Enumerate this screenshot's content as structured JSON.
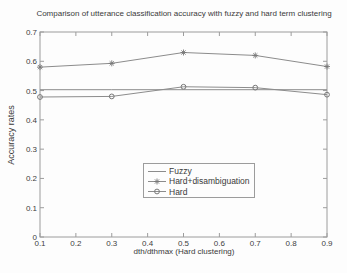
{
  "chart_data": {
    "type": "line",
    "title": "Comparison of utterance classification accuracy with fuzzy and hard term clustering",
    "xlabel": "dth/dthmax (Hard clustering)",
    "ylabel": "Accuracy rates",
    "xlim": [
      0.1,
      0.9
    ],
    "ylim": [
      0,
      0.7
    ],
    "xticks": [
      0.1,
      0.2,
      0.3,
      0.4,
      0.5,
      0.6,
      0.7,
      0.8,
      0.9
    ],
    "yticks": [
      0,
      0.1,
      0.2,
      0.3,
      0.4,
      0.5,
      0.6,
      0.7
    ],
    "x": [
      0.1,
      0.3,
      0.5,
      0.7,
      0.9
    ],
    "series": [
      {
        "name": "Fuzzy",
        "marker": "none",
        "values": [
          0.503,
          0.503,
          0.503,
          0.503,
          0.503
        ]
      },
      {
        "name": "Hard+disambiguation",
        "marker": "asterisk",
        "values": [
          0.58,
          0.593,
          0.63,
          0.62,
          0.582
        ]
      },
      {
        "name": "Hard",
        "marker": "circle",
        "values": [
          0.478,
          0.48,
          0.513,
          0.51,
          0.486
        ]
      }
    ],
    "grid": false,
    "legend_position": "lower-center-inside",
    "colors": {
      "line": "#8c8c8c",
      "marker": "#787878",
      "axis": "#9c9c9c",
      "text": "#3d3d3d"
    }
  }
}
